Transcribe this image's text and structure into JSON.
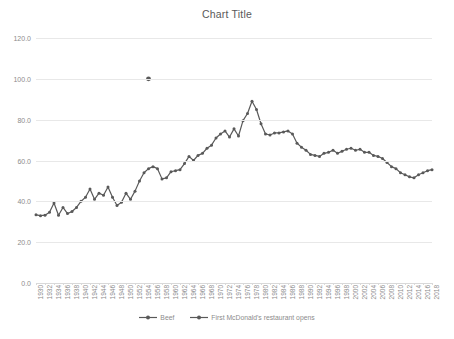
{
  "chart_data": {
    "type": "line",
    "title": "Chart Title",
    "xlabel": "",
    "ylabel": "",
    "ylim": [
      0,
      120
    ],
    "ytick_step": 20,
    "ytick_labels": [
      "0.0",
      "20.0",
      "40.0",
      "60.0",
      "80.0",
      "100.0",
      "120.0"
    ],
    "ytick_values": [
      0,
      20,
      40,
      60,
      80,
      100,
      120
    ],
    "grid": true,
    "legend_position": "bottom",
    "x_label_rotation": -90,
    "x_label_interval": 2,
    "categories": [
      "1930",
      "1931",
      "1932",
      "1933",
      "1934",
      "1935",
      "1936",
      "1937",
      "1938",
      "1939",
      "1940",
      "1941",
      "1942",
      "1943",
      "1944",
      "1945",
      "1946",
      "1947",
      "1948",
      "1949",
      "1950",
      "1951",
      "1952",
      "1953",
      "1954",
      "1955",
      "1956",
      "1957",
      "1958",
      "1959",
      "1960",
      "1961",
      "1962",
      "1963",
      "1964",
      "1965",
      "1966",
      "1967",
      "1968",
      "1969",
      "1970",
      "1971",
      "1972",
      "1973",
      "1974",
      "1975",
      "1976",
      "1977",
      "1978",
      "1979",
      "1980",
      "1981",
      "1982",
      "1983",
      "1984",
      "1985",
      "1986",
      "1987",
      "1988",
      "1989",
      "1990",
      "1991",
      "1992",
      "1993",
      "1994",
      "1995",
      "1996",
      "1997",
      "1998",
      "1999",
      "2000",
      "2001",
      "2002",
      "2003",
      "2004",
      "2005",
      "2006",
      "2007",
      "2008",
      "2009",
      "2010",
      "2011",
      "2012",
      "2013",
      "2014",
      "2015",
      "2016",
      "2017",
      "2018"
    ],
    "visible_xtick_labels": [
      "1930",
      "1932",
      "1934",
      "1936",
      "1938",
      "1940",
      "1942",
      "1944",
      "1946",
      "1948",
      "1950",
      "1952",
      "1954",
      "1956",
      "1958",
      "1960",
      "1962",
      "1964",
      "1966",
      "1968",
      "1970",
      "1972",
      "1974",
      "1976",
      "1978",
      "1980",
      "1982",
      "1984",
      "1986",
      "1988",
      "1990",
      "1992",
      "1994",
      "1996",
      "1998",
      "2000",
      "2002",
      "2004",
      "2006",
      "2008",
      "2010",
      "2012",
      "2014",
      "2016",
      "2018"
    ],
    "series": [
      {
        "name": "Beef",
        "color": "#595959",
        "marker": "circle",
        "values": [
          33.4,
          33.0,
          33.2,
          34.6,
          39.2,
          33.2,
          37.0,
          34.0,
          35.0,
          37.0,
          40.0,
          42.0,
          46.0,
          41.0,
          44.0,
          43.0,
          47.0,
          42.0,
          38.0,
          39.5,
          44.0,
          41.0,
          45.0,
          50.0,
          54.0,
          56.0,
          57.0,
          56.0,
          51.0,
          51.5,
          54.5,
          55.0,
          55.5,
          58.5,
          62.0,
          60.0,
          62.5,
          63.5,
          66.0,
          67.5,
          71.0,
          73.0,
          74.5,
          71.5,
          75.5,
          72.0,
          79.5,
          83.0,
          89.0,
          85.0,
          78.0,
          73.0,
          72.5,
          73.5,
          73.5,
          74.0,
          74.5,
          73.0,
          68.5,
          66.5,
          65.0,
          63.0,
          62.5,
          62.0,
          63.5,
          64.0,
          65.0,
          63.5,
          64.5,
          65.5,
          66.0,
          65.0,
          65.5,
          64.0,
          64.0,
          62.5,
          62.0,
          61.0,
          59.0,
          57.0,
          56.0,
          54.0,
          53.0,
          52.0,
          51.5,
          53.0,
          54.0,
          55.0,
          55.5
        ]
      },
      {
        "name": "First McDonald's restaurant opens",
        "color": "#595959",
        "marker": "circle",
        "point_x": "1955",
        "point_y": 100,
        "values": [
          null,
          null,
          null,
          null,
          null,
          null,
          null,
          null,
          null,
          null,
          null,
          null,
          null,
          null,
          null,
          null,
          null,
          null,
          null,
          null,
          null,
          null,
          null,
          null,
          null,
          100,
          null,
          null,
          null,
          null,
          null,
          null,
          null,
          null,
          null,
          null,
          null,
          null,
          null,
          null,
          null,
          null,
          null,
          null,
          null,
          null,
          null,
          null,
          null,
          null,
          null,
          null,
          null,
          null,
          null,
          null,
          null,
          null,
          null,
          null,
          null,
          null,
          null,
          null,
          null,
          null,
          null,
          null,
          null,
          null,
          null,
          null,
          null,
          null,
          null,
          null,
          null,
          null,
          null,
          null,
          null,
          null,
          null,
          null,
          null,
          null,
          null,
          null,
          null
        ]
      }
    ]
  }
}
